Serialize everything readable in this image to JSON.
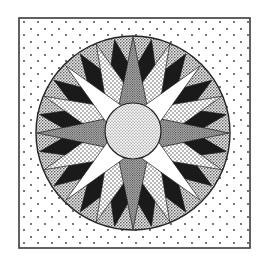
{
  "canvas": {
    "width": 266,
    "height": 258,
    "background": "#ffffff"
  },
  "block": {
    "x": 19,
    "y": 18,
    "width": 231,
    "height": 230,
    "stroke": "#3a3a3a",
    "stroke_width": 1.6,
    "fill_pattern": "sparse-dots"
  },
  "compass": {
    "cx": 133,
    "cy": 133,
    "r": 97,
    "ring_stroke": "#222222",
    "ring_fill_pattern": "medium-stipple",
    "center_circle": {
      "r": 28,
      "fill_pattern": "fine-stipple"
    },
    "layers": [
      {
        "name": "black-points",
        "count": 16,
        "offset_deg": 11.25,
        "half_width_deg": 5.5,
        "inner_r": 60,
        "tip_r": 95,
        "fill": "#1a1a1a"
      },
      {
        "name": "medium-dot-points",
        "count": 8,
        "offset_deg": 22.5,
        "half_width_deg": 9,
        "inner_r": 40,
        "tip_r": 96,
        "fill_pattern": "coarse-dots"
      },
      {
        "name": "dense-cardinal-points",
        "count": 4,
        "offset_deg": 0,
        "half_width_deg": 13,
        "inner_r": 30,
        "tip_r": 96,
        "fill_pattern": "dense-stipple"
      },
      {
        "name": "white-star-points",
        "count": 4,
        "offset_deg": 45,
        "half_width_deg": 16,
        "inner_r": 22,
        "tip_r": 95,
        "fill": "#ffffff"
      }
    ]
  },
  "colors": {
    "ink": "#1a1a1a",
    "paper": "#ffffff",
    "dot": "#333333"
  }
}
